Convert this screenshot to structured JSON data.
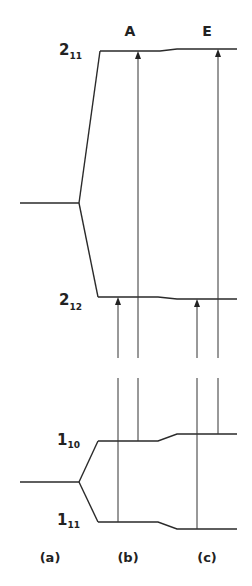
{
  "diagram": {
    "column_headers": {
      "b": "A",
      "c": "E"
    },
    "levels": {
      "upper_high": {
        "main": "2",
        "sub": "11"
      },
      "upper_low": {
        "main": "2",
        "sub": "12"
      },
      "lower_high": {
        "main": "1",
        "sub": "10"
      },
      "lower_low": {
        "main": "1",
        "sub": "11"
      }
    },
    "column_labels": [
      "(a)",
      "(b)",
      "(c)"
    ],
    "line_color": "#2a2a2a"
  }
}
